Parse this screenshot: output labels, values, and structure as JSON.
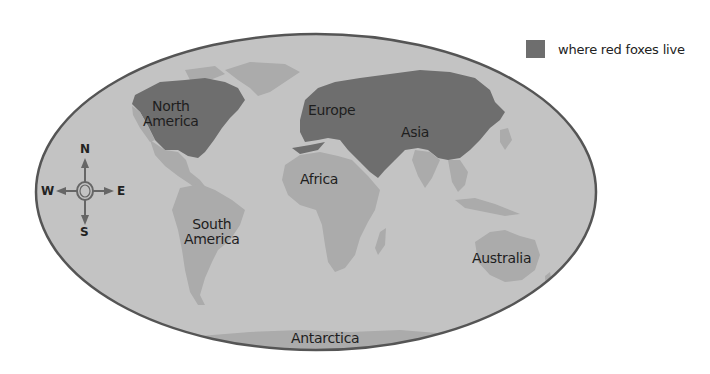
{
  "legend": {
    "swatch_color": "#6e6e6e",
    "label": "where red foxes live"
  },
  "colors": {
    "ocean": "#c3c3c3",
    "land": "#ababab",
    "fox_range": "#6e6e6e",
    "outline": "#555555"
  },
  "continents": {
    "north_america": "North\nAmerica",
    "north_america_line1": "North",
    "north_america_line2": "America",
    "europe": "Europe",
    "asia": "Asia",
    "africa": "Africa",
    "south_america_line1": "South",
    "south_america_line2": "America",
    "australia": "Australia",
    "antarctica": "Antarctica"
  },
  "compass": {
    "n": "N",
    "s": "S",
    "e": "E",
    "w": "W"
  }
}
